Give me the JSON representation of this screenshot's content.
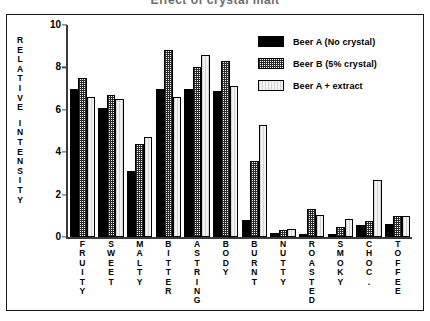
{
  "title": "Effect of crystal malt",
  "legend": {
    "position": "top-right",
    "entries": [
      {
        "label": "Beer A (No crystal)",
        "pattern": "solid-black"
      },
      {
        "label": "Beer B (5% crystal)",
        "pattern": "dense-dot-hatch"
      },
      {
        "label": "Beer A + extract",
        "pattern": "light-vertical-lines"
      }
    ]
  },
  "y_axis": {
    "caption_letters": [
      "R",
      "E",
      "L",
      "A",
      "T",
      "I",
      "V",
      "E",
      "",
      "I",
      "N",
      "T",
      "E",
      "N",
      "S",
      "I",
      "T",
      "Y"
    ],
    "caption": "RELATIVE INTENSITY",
    "ticks": [
      "0",
      "2",
      "4",
      "6",
      "8",
      "10"
    ]
  },
  "chart_data": {
    "type": "bar",
    "title": "Effect of crystal malt",
    "xlabel": "",
    "ylabel": "RELATIVE INTENSITY",
    "ylim": [
      0,
      10
    ],
    "yticks": [
      0,
      2,
      4,
      6,
      8,
      10
    ],
    "grid": false,
    "legend_position": "top-right",
    "categories": [
      "FRUITY",
      "SWEET",
      "MALTY",
      "BITTER",
      "ASTRING",
      "BODY",
      "BURNT",
      "NUTTY",
      "ROASTED",
      "SMOKY",
      "CHOC.",
      "TOFFEE"
    ],
    "series": [
      {
        "name": "Beer A (No crystal)",
        "values": [
          7.0,
          6.1,
          3.1,
          7.0,
          7.0,
          6.9,
          0.8,
          0.2,
          0.15,
          0.15,
          0.55,
          0.6
        ]
      },
      {
        "name": "Beer B (5% crystal)",
        "values": [
          7.5,
          6.7,
          4.4,
          8.8,
          8.0,
          8.3,
          3.6,
          0.35,
          1.3,
          0.45,
          0.75,
          1.0
        ]
      },
      {
        "name": "Beer A + extract",
        "values": [
          6.6,
          6.5,
          4.7,
          6.6,
          8.6,
          7.1,
          5.3,
          0.4,
          1.05,
          0.85,
          2.7,
          1.0
        ]
      }
    ]
  }
}
